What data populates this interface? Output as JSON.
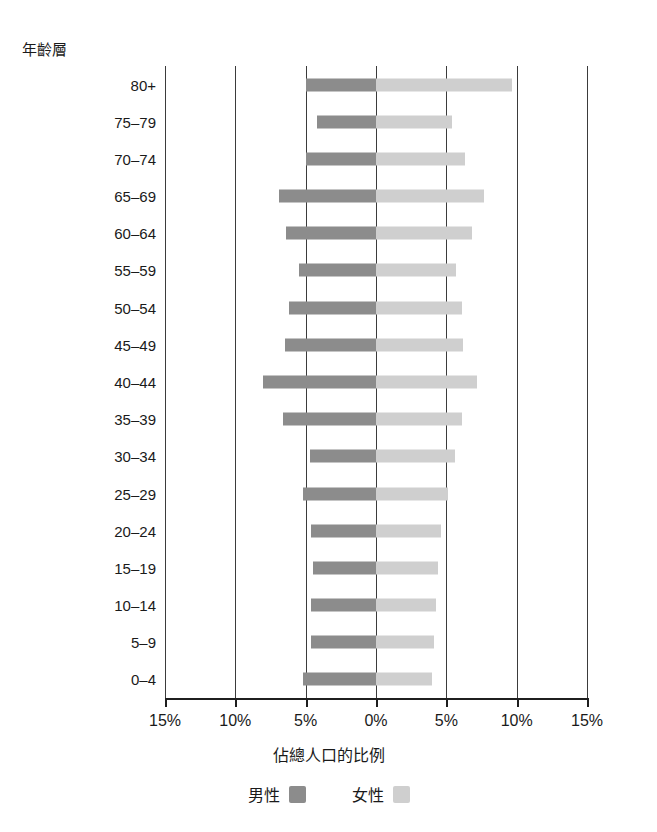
{
  "chart": {
    "title": "",
    "y_axis_caption": "年齡層",
    "x_axis_title": "佔總人口的比例",
    "x_tick_labels": [
      "15%",
      "10%",
      "5%",
      "0%",
      "5%",
      "10%",
      "15%"
    ],
    "legend": {
      "male_label": "男性",
      "female_label": "女性",
      "male_color": "#8c8c8c",
      "female_color": "#cfcfcf"
    }
  },
  "chart_data": {
    "type": "bar",
    "subtype": "population-pyramid",
    "title": "",
    "xlabel": "佔總人口的比例",
    "ylabel": "年齡層",
    "xlim": [
      -15,
      15
    ],
    "xticks": [
      -15,
      -10,
      -5,
      0,
      5,
      10,
      15
    ],
    "xtick_labels": [
      "15%",
      "10%",
      "5%",
      "0%",
      "5%",
      "10%",
      "15%"
    ],
    "grid": true,
    "legend_position": "bottom",
    "categories": [
      "80+",
      "75–79",
      "70–74",
      "65–69",
      "60–64",
      "55–59",
      "50–54",
      "45–49",
      "40–44",
      "35–39",
      "30–34",
      "25–29",
      "20–24",
      "15–19",
      "10–14",
      "5–9",
      "0–4"
    ],
    "series": [
      {
        "name": "男性",
        "color": "#8c8c8c",
        "side": "left",
        "values": [
          5.0,
          4.2,
          5.0,
          6.9,
          6.4,
          5.5,
          6.2,
          6.5,
          8.0,
          6.6,
          4.7,
          5.2,
          4.6,
          4.5,
          4.6,
          4.6,
          5.2
        ]
      },
      {
        "name": "女性",
        "color": "#cfcfcf",
        "side": "right",
        "values": [
          9.7,
          5.4,
          6.3,
          7.7,
          6.8,
          5.7,
          6.1,
          6.2,
          7.2,
          6.1,
          5.6,
          5.1,
          4.6,
          4.4,
          4.3,
          4.1,
          4.0
        ]
      }
    ]
  }
}
